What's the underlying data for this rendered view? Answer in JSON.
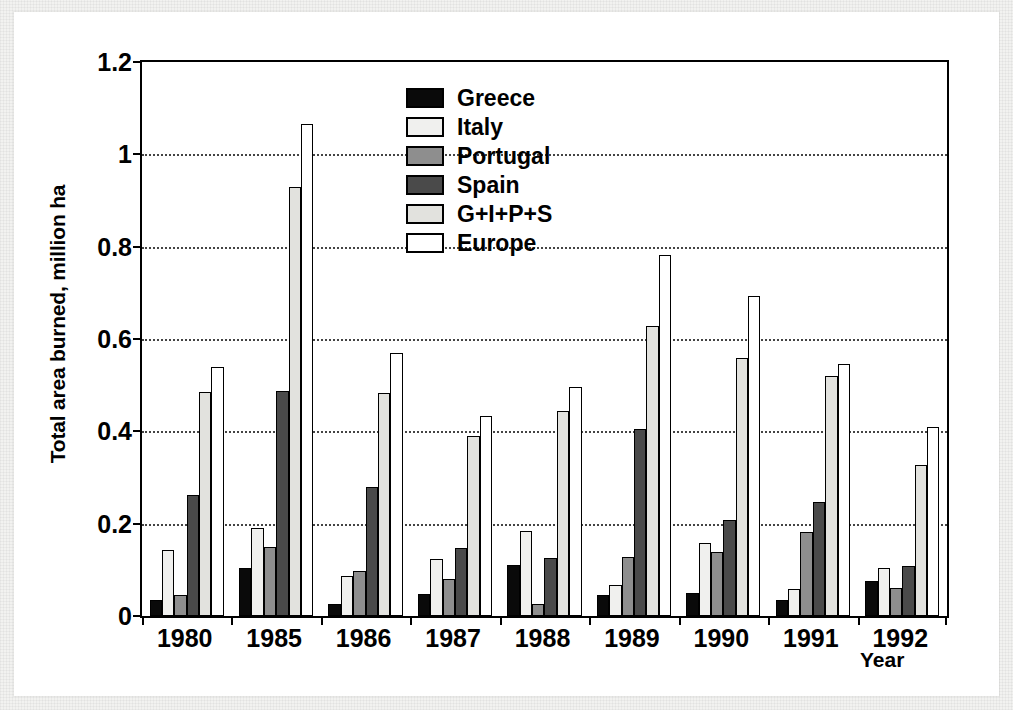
{
  "figure": {
    "ylabel": "Total area burned, million ha",
    "xlabel": "Year"
  },
  "legend": {
    "items": [
      {
        "label": "Greece",
        "key": "greece",
        "color": "#0a0a0a"
      },
      {
        "label": "Italy",
        "key": "italy",
        "color": "#f0f0ee"
      },
      {
        "label": "Portugal",
        "key": "portugal",
        "color": "#8e8e8e"
      },
      {
        "label": "Spain",
        "key": "spain",
        "color": "#4a4a4a"
      },
      {
        "label": "G+I+P+S",
        "key": "gips",
        "color": "#e2e2de"
      },
      {
        "label": "Europe",
        "key": "europe",
        "color": "#ffffff"
      }
    ]
  },
  "chart_data": {
    "type": "bar",
    "title": "",
    "xlabel": "Year",
    "ylabel": "Total area burned, million ha",
    "categories": [
      "1980",
      "1985",
      "1986",
      "1987",
      "1988",
      "1989",
      "1990",
      "1991",
      "1992"
    ],
    "ylim": [
      0,
      1.2
    ],
    "yticks": [
      "0",
      "0.2",
      "0.4",
      "0.6",
      "0.8",
      "1",
      "1.2"
    ],
    "ytick_values": [
      0,
      0.2,
      0.4,
      0.6,
      0.8,
      1.0,
      1.2
    ],
    "grid": "horizontal-dotted",
    "legend_position": "upper-center",
    "series": [
      {
        "name": "Greece",
        "color": "#0a0a0a",
        "values": [
          0.035,
          0.105,
          0.025,
          0.048,
          0.11,
          0.045,
          0.05,
          0.035,
          0.075
        ]
      },
      {
        "name": "Italy",
        "color": "#f0f0ee",
        "values": [
          0.143,
          0.19,
          0.086,
          0.123,
          0.185,
          0.068,
          0.158,
          0.058,
          0.105
        ]
      },
      {
        "name": "Portugal",
        "color": "#8e8e8e",
        "values": [
          0.045,
          0.15,
          0.098,
          0.08,
          0.025,
          0.128,
          0.138,
          0.182,
          0.06
        ]
      },
      {
        "name": "Spain",
        "color": "#4a4a4a",
        "values": [
          0.263,
          0.488,
          0.28,
          0.148,
          0.125,
          0.405,
          0.208,
          0.248,
          0.108
        ]
      },
      {
        "name": "G+I+P+S",
        "color": "#e2e2de",
        "values": [
          0.485,
          0.93,
          0.483,
          0.39,
          0.445,
          0.628,
          0.558,
          0.52,
          0.328
        ]
      },
      {
        "name": "Europe",
        "color": "#ffffff",
        "values": [
          0.54,
          1.065,
          0.57,
          0.433,
          0.495,
          0.783,
          0.693,
          0.545,
          0.41
        ]
      }
    ]
  }
}
